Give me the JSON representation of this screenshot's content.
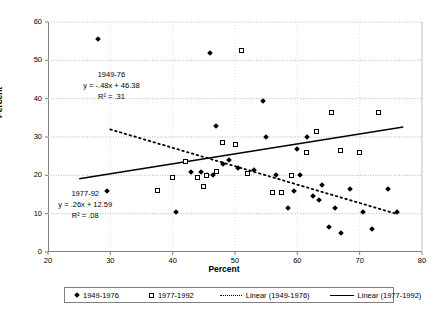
{
  "chart_data": {
    "type": "scatter",
    "title": "",
    "xlabel": "Percent",
    "ylabel": "Percent",
    "xlim": [
      20,
      80
    ],
    "ylim": [
      0,
      60
    ],
    "xticks": [
      20,
      30,
      40,
      50,
      60,
      70,
      80
    ],
    "yticks": [
      0,
      10,
      20,
      30,
      40,
      50,
      60
    ],
    "grid": true,
    "legend_position": "bottom",
    "series": [
      {
        "name": "1949-1976",
        "marker": "filled-diamond",
        "points": [
          [
            28.0,
            55.5
          ],
          [
            29.5,
            16.0
          ],
          [
            46.0,
            52.0
          ],
          [
            40.5,
            10.5
          ],
          [
            43.0,
            21.0
          ],
          [
            44.5,
            21.0
          ],
          [
            45.5,
            20.0
          ],
          [
            46.5,
            20.0
          ],
          [
            47.0,
            33.0
          ],
          [
            48.0,
            23.0
          ],
          [
            49.0,
            24.0
          ],
          [
            50.5,
            22.0
          ],
          [
            54.5,
            39.5
          ],
          [
            53.0,
            21.5
          ],
          [
            55.0,
            30.0
          ],
          [
            56.5,
            20.0
          ],
          [
            58.5,
            11.5
          ],
          [
            59.5,
            16.0
          ],
          [
            60.0,
            27.0
          ],
          [
            60.5,
            20.0
          ],
          [
            61.5,
            30.0
          ],
          [
            62.5,
            14.5
          ],
          [
            63.5,
            13.5
          ],
          [
            64.0,
            17.5
          ],
          [
            65.0,
            6.5
          ],
          [
            66.0,
            11.5
          ],
          [
            67.0,
            5.0
          ],
          [
            68.5,
            16.5
          ],
          [
            70.5,
            10.5
          ],
          [
            72.0,
            6.0
          ],
          [
            74.5,
            16.5
          ],
          [
            76.0,
            10.5
          ]
        ]
      },
      {
        "name": "1977-1992",
        "marker": "open-square",
        "points": [
          [
            37.5,
            16.0
          ],
          [
            40.0,
            19.5
          ],
          [
            42.0,
            23.5
          ],
          [
            44.0,
            19.5
          ],
          [
            45.0,
            17.0
          ],
          [
            45.5,
            20.0
          ],
          [
            47.0,
            21.0
          ],
          [
            48.0,
            28.5
          ],
          [
            50.0,
            28.0
          ],
          [
            51.0,
            52.5
          ],
          [
            52.0,
            20.5
          ],
          [
            56.0,
            15.5
          ],
          [
            57.5,
            15.5
          ],
          [
            59.0,
            20.0
          ],
          [
            61.5,
            26.0
          ],
          [
            63.0,
            31.5
          ],
          [
            65.5,
            36.5
          ],
          [
            67.0,
            26.5
          ],
          [
            70.0,
            26.0
          ],
          [
            73.0,
            36.5
          ]
        ]
      }
    ],
    "trendlines": [
      {
        "name": "Linear (1949-1976)",
        "style": "dashed",
        "equation": "y = -.48x + 46.38",
        "r2": ".31",
        "slope": -0.48,
        "intercept": 46.38,
        "x_from": 30,
        "x_to": 76
      },
      {
        "name": "Linear (1977-1992)",
        "style": "solid",
        "equation": "y = .26x + 12.59",
        "r2": ".08",
        "slope": 0.26,
        "intercept": 12.59,
        "x_from": 25,
        "x_to": 77
      }
    ],
    "annotations": [
      {
        "id": "annot-1949",
        "line1": "1949-76",
        "line2": "y = -.48x + 46.38",
        "line3": "R² = .31",
        "x": 34,
        "y": 43.5
      },
      {
        "id": "annot-1977",
        "line1": "1977-92",
        "line2": "y = .26x + 12.59",
        "line3": "R² = .08",
        "x": 30,
        "y": 12.5
      }
    ],
    "legend": [
      {
        "label": "1949-1976",
        "marker": "filled-diamond"
      },
      {
        "label": "1977-1992",
        "marker": "open-square"
      },
      {
        "label": "Linear (1949-1976)",
        "marker": "dashed-line"
      },
      {
        "label": "Linear (1977-1992)",
        "marker": "solid-line"
      }
    ]
  },
  "axes": {
    "y_title": "Percent",
    "x_title": "Percent",
    "y_tick_labels": [
      "0",
      "10",
      "20",
      "30",
      "40",
      "50",
      "60"
    ],
    "x_tick_labels": [
      "20",
      "30",
      "40",
      "50",
      "60",
      "70",
      "80"
    ]
  },
  "colors": {
    "marker": "#000000",
    "gridline": "#b4b4b4",
    "axis": "#808080",
    "background": "#ffffff"
  }
}
